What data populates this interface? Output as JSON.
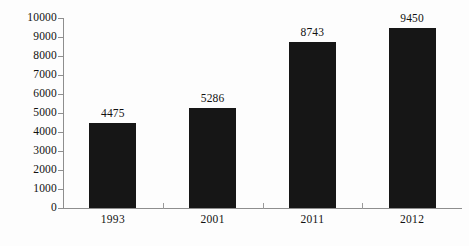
{
  "chart_data": {
    "type": "bar",
    "title": "",
    "subtitle": "",
    "xlabel": "",
    "ylabel": "",
    "categories": [
      "1993",
      "2001",
      "2011",
      "2012"
    ],
    "values": [
      4475,
      5286,
      8743,
      9450
    ],
    "data_labels": [
      "4475",
      "5286",
      "8743",
      "9450"
    ],
    "ylim": [
      0,
      10000
    ],
    "ytick_labels": [
      "10000",
      "9000",
      "8000",
      "7000",
      "6000",
      "5000",
      "4000",
      "3000",
      "2000",
      "1000",
      "0"
    ],
    "ytick_values": [
      10000,
      9000,
      8000,
      7000,
      6000,
      5000,
      4000,
      3000,
      2000,
      1000,
      0
    ],
    "grid": false,
    "legend": false,
    "legend_position": "none",
    "bar_color": "#161616",
    "axis_color": "#8e8e8e",
    "text_color": "#111111",
    "background_color": "#fdfdfd"
  }
}
